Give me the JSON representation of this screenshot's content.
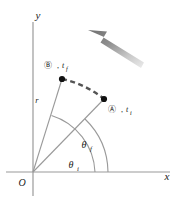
{
  "figure": {
    "background_color": "#ffffff",
    "axes": {
      "x_label": "x",
      "y_label": "y",
      "origin_label": "O",
      "axis_color": "#9a9a9a",
      "origin_px": [
        33,
        172
      ],
      "x_axis_end_px": [
        170,
        172
      ],
      "y_axis_top_px": [
        33,
        22
      ],
      "y_axis_bottom_px": [
        33,
        196
      ]
    },
    "radius": {
      "label": "r",
      "label_px": [
        37,
        100
      ],
      "line_color": "#9a9a9a",
      "length_px": 100
    },
    "points": [
      {
        "id": "B",
        "marker": "Ⓑ",
        "time_label": "t",
        "time_subscript": "f",
        "separator": ",",
        "dot_px": [
          62,
          79
        ],
        "label_px": [
          48,
          70
        ],
        "dot_color": "#111111"
      },
      {
        "id": "A",
        "marker": "Ⓐ",
        "time_label": "t",
        "time_subscript": "i",
        "separator": ",",
        "dot_px": [
          104,
          99
        ],
        "label_px": [
          110,
          110
        ],
        "dot_color": "#111111"
      }
    ],
    "angles": [
      {
        "name": "theta-f",
        "symbol": "θ",
        "subscript": "f",
        "label_px": [
          88,
          145
        ],
        "arc_radius_px": 62,
        "from_deg": 0,
        "to_deg": 67,
        "arc_color": "#9a9a9a"
      },
      {
        "name": "theta-i",
        "symbol": "θ",
        "subscript": "i",
        "label_px": [
          75,
          167
        ],
        "arc_radius_px": 42,
        "from_deg": 0,
        "to_deg": 37,
        "arc_color": "#9a9a9a"
      }
    ],
    "arc_path": {
      "name": "dashed-trajectory-arc",
      "style": "dashed",
      "color": "#555555",
      "dash_pattern": "5 3.5",
      "stroke_width": 2.4,
      "from_px": [
        62,
        79
      ],
      "to_px": [
        104,
        99
      ]
    },
    "motion_arrow": {
      "name": "rotation-direction-arrow",
      "direction": "up-left",
      "tip_px": [
        88,
        30
      ],
      "tail_px": [
        140,
        66
      ],
      "color_dark": "#6f6f6f",
      "color_light": "#e2e2e2"
    }
  }
}
